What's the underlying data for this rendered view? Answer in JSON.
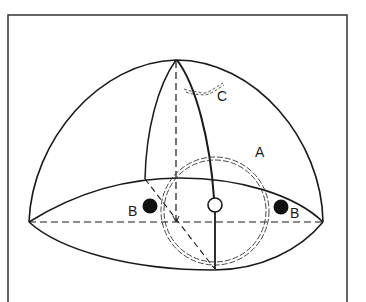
{
  "diagram": {
    "type": "hemisphere-schematic",
    "labels": {
      "a": "A",
      "b_left": "B",
      "b_right": "B",
      "c": "C"
    },
    "colors": {
      "stroke": "#1a1a1a",
      "background": "#ffffff",
      "filled_dot": "#111111",
      "open_dot": "#ffffff"
    },
    "elements": [
      {
        "id": "frame",
        "kind": "rectangle"
      },
      {
        "id": "dome",
        "kind": "hemisphere-outline"
      },
      {
        "id": "base",
        "kind": "ellipse-base"
      },
      {
        "id": "equator-axis",
        "kind": "dashed-line"
      },
      {
        "id": "vertical-axis",
        "kind": "dashed-line"
      },
      {
        "id": "meridian-left",
        "kind": "solid-curve"
      },
      {
        "id": "meridian-right",
        "kind": "solid-curve"
      },
      {
        "id": "circle-a",
        "kind": "double-dashed-circle",
        "label": "A"
      },
      {
        "id": "dot-b-left",
        "kind": "filled-dot",
        "label": "B"
      },
      {
        "id": "dot-b-right",
        "kind": "filled-dot",
        "label": "B"
      },
      {
        "id": "center-dot",
        "kind": "open-dot"
      },
      {
        "id": "arc-c",
        "kind": "wavy-dashed-arc",
        "label": "C"
      }
    ]
  }
}
